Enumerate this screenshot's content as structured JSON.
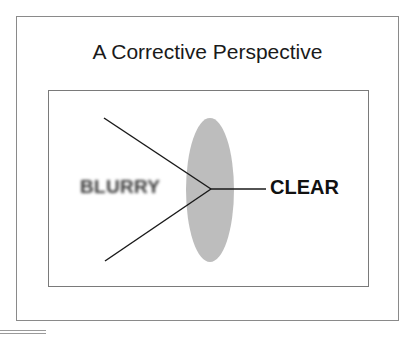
{
  "title": "A Corrective Perspective",
  "labels": {
    "blurry": "BLURRY",
    "clear": "CLEAR"
  },
  "colors": {
    "lens": "#bdbdbd",
    "lines": "#1a1a1a",
    "frame": "#8a8a8a"
  }
}
